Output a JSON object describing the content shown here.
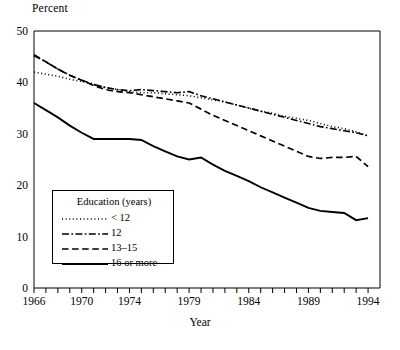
{
  "chart_data": {
    "type": "line",
    "title": "",
    "xlabel": "Year",
    "ylabel": "Percent",
    "ylim": [
      0,
      50
    ],
    "xlim": [
      1966,
      1995
    ],
    "grid": false,
    "legend_position": "inside-lower-left",
    "legend_title": "Education (years)",
    "ytick_labels": [
      "0",
      "10",
      "20",
      "30",
      "40",
      "50"
    ],
    "ytick_values": [
      0,
      10,
      20,
      30,
      40,
      50
    ],
    "xtick_labels": [
      "1966",
      "1970",
      "1974",
      "1979",
      "1984",
      "1989",
      "1994"
    ],
    "xtick_values": [
      1966,
      1970,
      1974,
      1979,
      1984,
      1989,
      1994
    ],
    "x": [
      1966,
      1967,
      1968,
      1969,
      1970,
      1971,
      1972,
      1973,
      1974,
      1975,
      1976,
      1977,
      1978,
      1979,
      1980,
      1981,
      1982,
      1983,
      1984,
      1985,
      1986,
      1987,
      1988,
      1989,
      1990,
      1991,
      1992,
      1993,
      1994
    ],
    "series": [
      {
        "name": "< 12",
        "style": "dotted",
        "color": "#000000",
        "values": [
          42.0,
          41.6,
          41.2,
          40.6,
          40.2,
          39.6,
          39.0,
          38.6,
          38.2,
          38.0,
          38.0,
          37.8,
          37.6,
          37.4,
          37.0,
          36.6,
          36.2,
          35.6,
          35.0,
          34.4,
          34.0,
          33.4,
          33.0,
          32.6,
          32.0,
          31.4,
          31.0,
          30.4,
          29.6
        ]
      },
      {
        "name": "12",
        "style": "dashdot",
        "color": "#000000",
        "values": [
          45.2,
          44.0,
          42.6,
          41.4,
          40.4,
          39.6,
          39.0,
          38.6,
          38.4,
          38.6,
          38.4,
          38.2,
          38.0,
          38.2,
          37.4,
          36.8,
          36.2,
          35.6,
          35.0,
          34.4,
          33.8,
          33.2,
          32.6,
          32.0,
          31.4,
          31.0,
          30.6,
          30.2,
          29.6
        ]
      },
      {
        "name": "13–15",
        "style": "dashed",
        "color": "#000000",
        "values": [
          45.4,
          44.0,
          42.6,
          41.4,
          40.4,
          39.4,
          38.6,
          38.2,
          38.0,
          37.6,
          37.2,
          36.8,
          36.4,
          36.0,
          34.8,
          33.6,
          32.6,
          31.6,
          30.6,
          29.6,
          28.6,
          27.6,
          26.6,
          25.6,
          25.2,
          25.4,
          25.4,
          25.6,
          23.6
        ]
      },
      {
        "name": "16 or more",
        "style": "solid",
        "color": "#000000",
        "values": [
          36.0,
          34.6,
          33.2,
          31.6,
          30.2,
          29.0,
          29.0,
          29.0,
          29.0,
          28.8,
          27.6,
          26.6,
          25.6,
          25.0,
          25.4,
          24.0,
          22.8,
          21.8,
          20.8,
          19.6,
          18.6,
          17.6,
          16.6,
          15.6,
          15.0,
          14.8,
          14.6,
          13.2,
          13.6
        ]
      }
    ]
  }
}
